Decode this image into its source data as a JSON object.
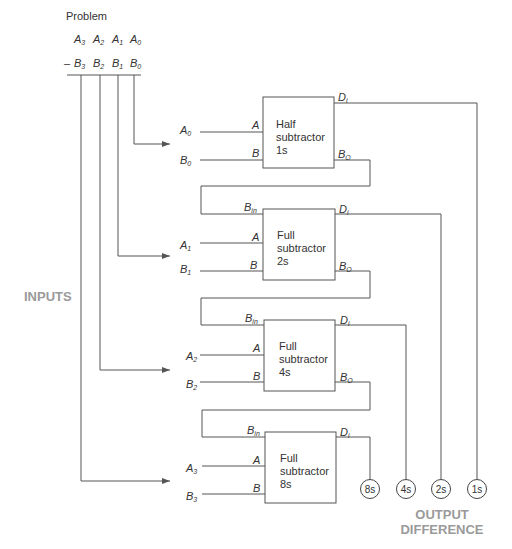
{
  "problem": {
    "title": "Problem",
    "minus": "–",
    "a_row": [
      {
        "base": "A",
        "sub": "3"
      },
      {
        "base": "A",
        "sub": "2"
      },
      {
        "base": "A",
        "sub": "1"
      },
      {
        "base": "A",
        "sub": "0"
      }
    ],
    "b_row": [
      {
        "base": "B",
        "sub": "3"
      },
      {
        "base": "B",
        "sub": "2"
      },
      {
        "base": "B",
        "sub": "1"
      },
      {
        "base": "B",
        "sub": "0"
      }
    ]
  },
  "side_label": "INPUTS",
  "blocks": [
    {
      "line1": "Half",
      "line2": "subtractor",
      "line3": "1s",
      "in_a_label": {
        "base": "A",
        "sub": "0"
      },
      "in_b_label": {
        "base": "B",
        "sub": "0"
      },
      "pin_a": "A",
      "pin_b": "B",
      "pin_bin": null,
      "pin_di": {
        "base": "D",
        "sub": "i"
      },
      "pin_bo": {
        "base": "B",
        "sub": "O"
      }
    },
    {
      "line1": "Full",
      "line2": "subtractor",
      "line3": "2s",
      "in_a_label": {
        "base": "A",
        "sub": "1"
      },
      "in_b_label": {
        "base": "B",
        "sub": "1"
      },
      "pin_a": "A",
      "pin_b": "B",
      "pin_bin": {
        "base": "B",
        "sub": "in"
      },
      "pin_di": {
        "base": "D",
        "sub": "i"
      },
      "pin_bo": {
        "base": "B",
        "sub": "O"
      }
    },
    {
      "line1": "Full",
      "line2": "subtractor",
      "line3": "4s",
      "in_a_label": {
        "base": "A",
        "sub": "2"
      },
      "in_b_label": {
        "base": "B",
        "sub": "2"
      },
      "pin_a": "A",
      "pin_b": "B",
      "pin_bin": {
        "base": "B",
        "sub": "in"
      },
      "pin_di": {
        "base": "D",
        "sub": "i"
      },
      "pin_bo": {
        "base": "B",
        "sub": "O"
      }
    },
    {
      "line1": "Full",
      "line2": "subtractor",
      "line3": "8s",
      "in_a_label": {
        "base": "A",
        "sub": "3"
      },
      "in_b_label": {
        "base": "B",
        "sub": "3"
      },
      "pin_a": "A",
      "pin_b": "B",
      "pin_bin": {
        "base": "B",
        "sub": "in"
      },
      "pin_di": {
        "base": "D",
        "sub": "i"
      },
      "pin_bo": null
    }
  ],
  "outputs": [
    "8s",
    "4s",
    "2s",
    "1s"
  ],
  "output_label": {
    "line1": "OUTPUT",
    "line2": "DIFFERENCE"
  },
  "colors": {
    "line": "#555555",
    "text": "#333333",
    "caption": "#9a9a9a"
  }
}
